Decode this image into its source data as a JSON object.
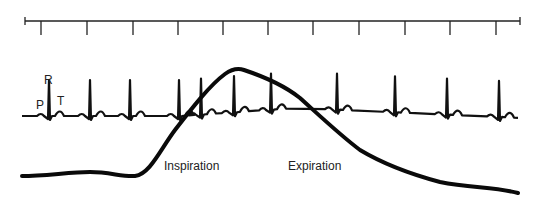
{
  "diagram": {
    "time_axis": {
      "start_x": 25,
      "end_x": 520,
      "y": 21,
      "ticks_x": [
        41,
        87,
        133,
        178,
        223,
        268,
        313,
        359,
        405,
        450,
        496
      ]
    },
    "ecg": {
      "wave_labels": {
        "p": "P",
        "r": "R",
        "t": "T"
      },
      "r_peaks_x": [
        49,
        90,
        130,
        179,
        201,
        234,
        271,
        337,
        395,
        447,
        499
      ]
    },
    "respiration": {
      "inspiration_label": "Inspiration",
      "expiration_label": "Expiration"
    },
    "colors": {
      "ink": "#111111",
      "background": "#ffffff"
    }
  }
}
